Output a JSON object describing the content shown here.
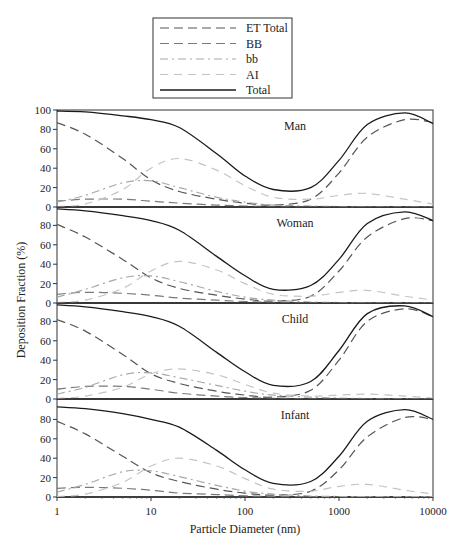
{
  "chart_data": {
    "type": "line",
    "title": "",
    "xlabel": "Particle Diameter (nm)",
    "ylabel": "Deposition Fraction (%)",
    "xscale": "log",
    "xlim": [
      1,
      10000
    ],
    "ylim": [
      0,
      100
    ],
    "xticks": [
      "1",
      "10",
      "100",
      "1000",
      "10000"
    ],
    "yticks_top_panel": [
      "0",
      "20",
      "40",
      "60",
      "80",
      "100"
    ],
    "yticks_other_panels": [
      "0",
      "20",
      "40",
      "60",
      "80"
    ],
    "grid": false,
    "legend_position": "top-center",
    "legend": [
      {
        "name": "ET Total",
        "style": "long-dash",
        "color": "#555555"
      },
      {
        "name": "BB",
        "style": "long-dash",
        "color": "#7a7a7a"
      },
      {
        "name": "bb",
        "style": "dash-dot",
        "color": "#a8a8a8"
      },
      {
        "name": "AI",
        "style": "dash",
        "color": "#c4c4c4"
      },
      {
        "name": "Total",
        "style": "solid",
        "color": "#1a1a1a"
      }
    ],
    "x": [
      1,
      2,
      5,
      10,
      20,
      50,
      100,
      200,
      500,
      1000,
      2000,
      5000,
      10000
    ],
    "panels": [
      {
        "label": "Man",
        "series": [
          {
            "name": "ET Total",
            "values": [
              87,
              75,
              50,
              28,
              16,
              8,
              4,
              2,
              8,
              35,
              72,
              90,
              87
            ]
          },
          {
            "name": "BB",
            "values": [
              6,
              8,
              8,
              6,
              4,
              2,
              1,
              0.5,
              0.5,
              0.5,
              0.5,
              0.5,
              0.5
            ]
          },
          {
            "name": "bb",
            "values": [
              5,
              12,
              25,
              27,
              20,
              10,
              5,
              2,
              1,
              0.5,
              0.5,
              0.5,
              0.5
            ]
          },
          {
            "name": "AI",
            "values": [
              0.5,
              3,
              18,
              40,
              50,
              38,
              22,
              10,
              8,
              12,
              14,
              8,
              3
            ]
          },
          {
            "name": "Total",
            "values": [
              99,
              98,
              94,
              90,
              82,
              55,
              32,
              18,
              20,
              48,
              85,
              97,
              86
            ]
          }
        ]
      },
      {
        "label": "Woman",
        "series": [
          {
            "name": "ET Total",
            "values": [
              81,
              68,
              45,
              26,
              15,
              8,
              4,
              2,
              7,
              33,
              68,
              87,
              85
            ]
          },
          {
            "name": "BB",
            "values": [
              9,
              11,
              10,
              8,
              5,
              3,
              1.5,
              0.7,
              0.5,
              0.5,
              0.5,
              0.5,
              0.5
            ]
          },
          {
            "name": "bb",
            "values": [
              6,
              14,
              26,
              28,
              22,
              12,
              6,
              3,
              1,
              0.5,
              0.5,
              0.5,
              0.5
            ]
          },
          {
            "name": "AI",
            "values": [
              0.5,
              3,
              15,
              33,
              43,
              34,
              20,
              9,
              7,
              11,
              13,
              7,
              3
            ]
          },
          {
            "name": "Total",
            "values": [
              97,
              95,
              90,
              85,
              75,
              48,
              28,
              14,
              18,
              45,
              82,
              94,
              85
            ]
          }
        ]
      },
      {
        "label": "Child",
        "series": [
          {
            "name": "ET Total",
            "values": [
              82,
              70,
              46,
              26,
              16,
              8,
              4,
              2,
              9,
              40,
              80,
              93,
              85
            ]
          },
          {
            "name": "BB",
            "values": [
              10,
              13,
              13,
              10,
              6,
              3,
              1.5,
              0.7,
              0.5,
              0.5,
              0.5,
              0.5,
              0.5
            ]
          },
          {
            "name": "bb",
            "values": [
              5,
              12,
              25,
              27,
              22,
              14,
              8,
              4,
              2,
              1,
              0.5,
              0.5,
              0.5
            ]
          },
          {
            "name": "AI",
            "values": [
              0.5,
              3,
              12,
              26,
              31,
              25,
              15,
              6,
              3,
              4,
              5,
              3,
              1
            ]
          },
          {
            "name": "Total",
            "values": [
              97,
              95,
              90,
              85,
              75,
              48,
              28,
              14,
              18,
              50,
              88,
              96,
              85
            ]
          }
        ]
      },
      {
        "label": "Infant",
        "series": [
          {
            "name": "ET Total",
            "values": [
              78,
              65,
              42,
              25,
              16,
              8,
              4,
              2,
              6,
              28,
              62,
              82,
              80
            ]
          },
          {
            "name": "BB",
            "values": [
              9,
              10,
              9,
              7,
              4,
              2.5,
              1.2,
              0.6,
              0.5,
              0.5,
              0.5,
              0.5,
              0.5
            ]
          },
          {
            "name": "bb",
            "values": [
              5,
              13,
              26,
              27,
              21,
              12,
              6,
              3,
              1,
              0.5,
              0.5,
              0.5,
              0.5
            ]
          },
          {
            "name": "AI",
            "values": [
              0.5,
              3,
              15,
              32,
              40,
              32,
              19,
              8,
              6,
              11,
              13,
              7,
              3
            ]
          },
          {
            "name": "Total",
            "values": [
              93,
              91,
              86,
              80,
              72,
              48,
              28,
              14,
              16,
              42,
              78,
              90,
              80
            ]
          }
        ]
      }
    ]
  }
}
